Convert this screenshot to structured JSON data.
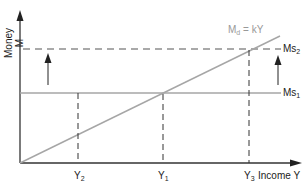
{
  "diagram": {
    "title": "",
    "y_axis_label": "Money  M",
    "x_axis_label": "Income Y",
    "demand_curve_label": {
      "main": "M",
      "sub": "d",
      "rest": " = kY"
    },
    "supply_lines": [
      {
        "id": "ms1",
        "main": "Ms",
        "sub": "1",
        "style": "solid",
        "color": "#a6a6a6"
      },
      {
        "id": "ms2",
        "main": "Ms",
        "sub": "2",
        "style": "dashed",
        "color": "#555555"
      }
    ],
    "x_ticks": [
      {
        "main": "Y",
        "sub": "2"
      },
      {
        "main": "Y",
        "sub": "1"
      },
      {
        "main": "Y",
        "sub": "3"
      }
    ],
    "colors": {
      "axis": "#333333",
      "demand_line": "#a6a6a6",
      "ms1_line": "#a6a6a6",
      "ms2_line": "#555555",
      "arrows": "#222222",
      "dashed_guides": "#333333"
    }
  }
}
